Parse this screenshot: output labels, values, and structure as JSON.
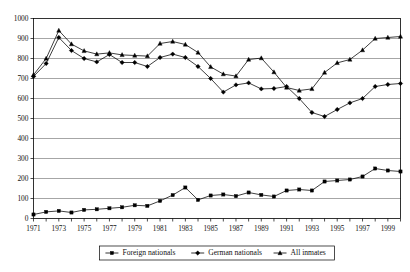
{
  "chart_data": {
    "type": "line",
    "title": "",
    "xlabel": "",
    "ylabel": "",
    "xlim": [
      1971,
      2000
    ],
    "ylim": [
      0,
      1000
    ],
    "ytick_step": 100,
    "grid": true,
    "legend_position": "bottom-center",
    "x": [
      1971,
      1972,
      1973,
      1974,
      1975,
      1976,
      1977,
      1978,
      1979,
      1980,
      1981,
      1982,
      1983,
      1984,
      1985,
      1986,
      1987,
      1988,
      1989,
      1990,
      1991,
      1992,
      1993,
      1994,
      1995,
      1996,
      1997,
      1998,
      1999,
      2000
    ],
    "xticklabels": [
      "1971",
      "",
      "1973",
      "",
      "1975",
      "",
      "1977",
      "",
      "1979",
      "",
      "1981",
      "",
      "1983",
      "",
      "1985",
      "",
      "1987",
      "",
      "1989",
      "",
      "1991",
      "",
      "1993",
      "",
      "1995",
      "",
      "1997",
      "",
      "1999",
      ""
    ],
    "yticklabels": [
      "0",
      "100",
      "200",
      "300",
      "400",
      "500",
      "600",
      "700",
      "800",
      "900",
      "1000"
    ],
    "yticks": [
      0,
      100,
      200,
      300,
      400,
      500,
      600,
      700,
      800,
      900,
      1000
    ],
    "series": [
      {
        "name": "Foreign nationals",
        "marker": "square",
        "values": [
          20,
          33,
          38,
          30,
          43,
          46,
          51,
          56,
          66,
          63,
          88,
          117,
          155,
          93,
          115,
          120,
          112,
          130,
          118,
          110,
          140,
          145,
          140,
          185,
          190,
          195,
          210,
          250,
          240,
          235
        ]
      },
      {
        "name": "German nationals",
        "marker": "diamond",
        "values": [
          710,
          775,
          905,
          840,
          800,
          783,
          820,
          780,
          780,
          760,
          805,
          822,
          805,
          760,
          700,
          632,
          668,
          678,
          648,
          650,
          660,
          600,
          530,
          510,
          545,
          578,
          600,
          660,
          670,
          675
        ]
      },
      {
        "name": "All inmates",
        "marker": "triangle",
        "values": [
          718,
          800,
          940,
          872,
          838,
          822,
          828,
          818,
          815,
          812,
          875,
          885,
          870,
          830,
          758,
          722,
          712,
          795,
          802,
          732,
          655,
          640,
          648,
          730,
          778,
          795,
          842,
          900,
          905,
          910
        ]
      }
    ]
  },
  "legend": {
    "items": [
      {
        "label": "Foreign nationals",
        "marker": "square"
      },
      {
        "label": "German nationals",
        "marker": "diamond"
      },
      {
        "label": "All inmates",
        "marker": "triangle"
      }
    ]
  }
}
